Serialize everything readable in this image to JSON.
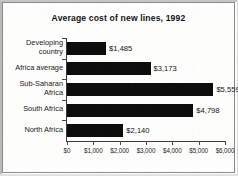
{
  "chart_data": {
    "type": "bar",
    "orientation": "horizontal",
    "title": "Average cost of new lines, 1992",
    "subtitle": "",
    "xlabel": "",
    "ylabel": "",
    "categories": [
      "Developing country",
      "Africa average",
      "Sub-Saharan Africa",
      "South Africa",
      "North Africa"
    ],
    "category_lines": [
      [
        "Developing",
        "country"
      ],
      [
        "Africa average"
      ],
      [
        "Sub-Saharan",
        "Africa"
      ],
      [
        "South Africa"
      ],
      [
        "North Africa"
      ]
    ],
    "values": [
      1485,
      3173,
      5559,
      4798,
      2140
    ],
    "value_labels": [
      "$1,485",
      "$3,173",
      "$5,559",
      "$4,798",
      "$2,140"
    ],
    "xlim": [
      0,
      6000
    ],
    "xticks": [
      0,
      1000,
      2000,
      3000,
      4000,
      5000,
      6000
    ],
    "xtick_labels": [
      "$0",
      "$1,000",
      "$2,000",
      "$3,000",
      "$4,000",
      "$5,000",
      "$6,000"
    ],
    "grid": false,
    "legend": null,
    "bar_color": "#0d0d0d",
    "background_color": "#fdfdfc",
    "axis_color": "#3a3a3a",
    "text_color": "#141414"
  }
}
